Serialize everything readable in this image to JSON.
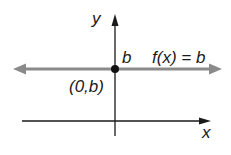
{
  "diagram": {
    "axes": {
      "x_label": "x",
      "y_label": "y"
    },
    "function_label": "f(x) = b",
    "intercept_label": "b",
    "point_label": "(0,b)",
    "colors": {
      "line": "#8a8a8a",
      "axis": "#1a1a1a",
      "point": "#111111"
    }
  }
}
